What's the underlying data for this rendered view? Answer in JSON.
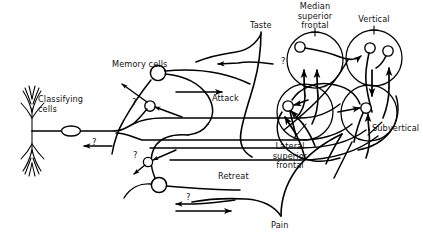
{
  "figure": {
    "ink_color": "#000000",
    "background_color": "#ffffff"
  },
  "labels": {
    "classifying_cells": "Classifying\ncells",
    "memory_cells": "Memory cells",
    "attack": "Attack",
    "retreat": "Retreat",
    "taste": "Taste",
    "pain": "Pain",
    "median_superior_frontal": "Median\nsuperior\nfrontal",
    "vertical": "Vertical",
    "lateral_superior_frontal": "Lateral\nsuperior\nfrontal",
    "subvertical": "Subvertical"
  },
  "question_marks": [
    {
      "id": "q-top-right",
      "text": "?"
    },
    {
      "id": "q-memory-upper",
      "text": "?"
    },
    {
      "id": "q-trunk-left",
      "text": "?"
    },
    {
      "id": "q-mid-lower",
      "text": "?"
    },
    {
      "id": "q-bottom",
      "text": "?"
    }
  ],
  "lobes": [
    {
      "name": "median-superior-frontal-lobe",
      "label": "Median\nsuperior\nfrontal"
    },
    {
      "name": "vertical-lobe",
      "label": "Vertical"
    },
    {
      "name": "lateral-superior-frontal-lobe",
      "label": "Lateral\nsuperior\nfrontal"
    },
    {
      "name": "subvertical-lobe",
      "label": "Subvertical"
    }
  ]
}
